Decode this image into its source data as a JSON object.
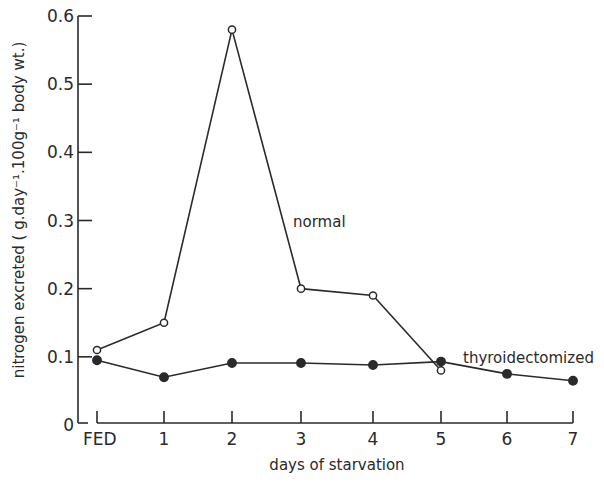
{
  "chart_data": {
    "type": "line",
    "title": "",
    "xlabel": "days of starvation",
    "ylabel": "nitrogen excreted ( g.day⁻¹.100g⁻¹ body wt.)",
    "categories": [
      "FED",
      "1",
      "2",
      "3",
      "4",
      "5",
      "6",
      "7"
    ],
    "ylim": [
      0,
      0.6
    ],
    "yticks": [
      "0",
      "0.1",
      "0.2",
      "0.3",
      "0.4",
      "0.5",
      "0.6"
    ],
    "grid": false,
    "legend": "inline labels",
    "series": [
      {
        "name": "normal",
        "marker": "open-circle",
        "values": [
          0.11,
          0.15,
          0.58,
          0.2,
          0.19,
          0.08,
          null,
          null
        ]
      },
      {
        "name": "thyroidectomized",
        "marker": "filled-circle",
        "values": [
          0.095,
          0.07,
          0.091,
          0.091,
          0.088,
          0.093,
          0.075,
          0.065
        ]
      }
    ],
    "annotations": [
      {
        "text": "normal",
        "x": "3",
        "y": 0.3
      },
      {
        "text": "thyroidectomized",
        "x": "5.5",
        "y": 0.1
      }
    ]
  },
  "layout": {
    "y_axis_x": 78,
    "y_zero_px": 425,
    "y_top_px": 16,
    "x_positions": [
      97,
      164,
      232,
      301,
      373,
      441,
      507,
      573
    ],
    "x_axis_end": 573,
    "line_color": "#2a2a2a"
  }
}
